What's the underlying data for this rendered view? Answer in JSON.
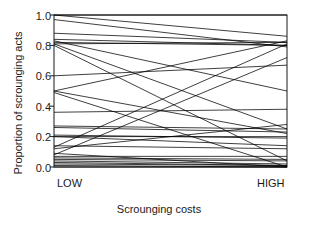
{
  "figure": {
    "background": "#ffffff",
    "width": 318,
    "height": 229
  },
  "axis": {
    "ylabel": "Proportion of scrounging acts",
    "xlabel": "Scrounging costs",
    "ytick_labels": [
      "1.0",
      "0.8",
      "0.6",
      "0.4",
      "0.2",
      "0.0"
    ],
    "ytick_values": [
      1.0,
      0.8,
      0.6,
      0.4,
      0.2,
      0.0
    ],
    "xtick_labels": [
      "LOW",
      "HIGH"
    ],
    "frame_color": "#000000",
    "line_color": "#000000"
  },
  "chart_data": {
    "type": "line",
    "title": "",
    "subtitle": "",
    "xlabel": "Scrounging costs",
    "ylabel": "Proportion of scrounging acts",
    "categories": [
      "LOW",
      "HIGH"
    ],
    "x": [
      0,
      1
    ],
    "xlim": [
      0,
      1
    ],
    "ylim": [
      0.0,
      1.0
    ],
    "yticks": [
      0.0,
      0.2,
      0.4,
      0.6,
      0.8,
      1.0
    ],
    "xticks": [
      0,
      1
    ],
    "grid": false,
    "legend": false,
    "legend_position": "none",
    "annotations": [],
    "series": [
      {
        "name": "s1",
        "values": [
          1.0,
          1.0
        ]
      },
      {
        "name": "s2",
        "values": [
          1.0,
          0.86
        ]
      },
      {
        "name": "s3",
        "values": [
          0.97,
          0.79
        ]
      },
      {
        "name": "s4",
        "values": [
          0.88,
          0.82
        ]
      },
      {
        "name": "s5",
        "values": [
          0.84,
          0.8
        ]
      },
      {
        "name": "s6",
        "values": [
          0.83,
          0.5
        ]
      },
      {
        "name": "s7",
        "values": [
          0.82,
          0.8
        ]
      },
      {
        "name": "s8",
        "values": [
          0.81,
          0.82
        ]
      },
      {
        "name": "s9",
        "values": [
          0.81,
          0.25
        ]
      },
      {
        "name": "s10",
        "values": [
          0.8,
          0.04
        ]
      },
      {
        "name": "s11",
        "values": [
          0.6,
          0.67
        ]
      },
      {
        "name": "s12",
        "values": [
          0.5,
          0.83
        ]
      },
      {
        "name": "s13",
        "values": [
          0.5,
          0.22
        ]
      },
      {
        "name": "s14",
        "values": [
          0.49,
          0.0
        ]
      },
      {
        "name": "s15",
        "values": [
          0.36,
          0.38
        ]
      },
      {
        "name": "s16",
        "values": [
          0.27,
          0.25
        ]
      },
      {
        "name": "s17",
        "values": [
          0.26,
          0.23
        ]
      },
      {
        "name": "s18",
        "values": [
          0.21,
          0.19
        ]
      },
      {
        "name": "s19",
        "values": [
          0.2,
          0.2
        ]
      },
      {
        "name": "s20",
        "values": [
          0.2,
          0.14
        ]
      },
      {
        "name": "s21",
        "values": [
          0.14,
          0.12
        ]
      },
      {
        "name": "s22",
        "values": [
          0.13,
          0.81
        ]
      },
      {
        "name": "s23",
        "values": [
          0.12,
          0.28
        ]
      },
      {
        "name": "s24",
        "values": [
          0.09,
          0.0
        ]
      },
      {
        "name": "s25",
        "values": [
          0.08,
          0.72
        ]
      },
      {
        "name": "s26",
        "values": [
          0.07,
          0.07
        ]
      },
      {
        "name": "s27",
        "values": [
          0.06,
          0.05
        ]
      },
      {
        "name": "s28",
        "values": [
          0.05,
          0.04
        ]
      },
      {
        "name": "s29",
        "values": [
          0.04,
          0.02
        ]
      },
      {
        "name": "s30",
        "values": [
          0.03,
          0.01
        ]
      },
      {
        "name": "s31",
        "values": [
          0.02,
          0.01
        ]
      },
      {
        "name": "s32",
        "values": [
          0.01,
          0.0
        ]
      },
      {
        "name": "s33",
        "values": [
          0.0,
          0.0
        ]
      }
    ]
  }
}
